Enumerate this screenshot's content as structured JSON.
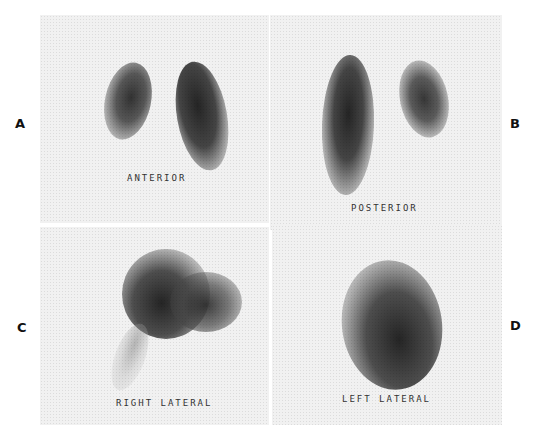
{
  "figure": {
    "panels": [
      {
        "letter": "A",
        "view": "ANTERIOR"
      },
      {
        "letter": "B",
        "view": "POSTERIOR"
      },
      {
        "letter": "C",
        "view": "RIGHT LATERAL"
      },
      {
        "letter": "D",
        "view": "LEFT LATERAL"
      }
    ]
  },
  "colors": {
    "panel_background": "#f1f1f1",
    "uptake": "#2a2a2a",
    "label_text": "#333333"
  }
}
